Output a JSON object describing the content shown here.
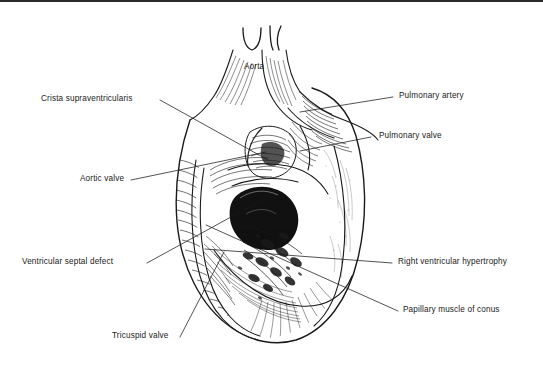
{
  "figure": {
    "kind": "anatomical-illustration",
    "style": "pen-and-ink line drawing",
    "background_color": "#ffffff",
    "ink_color": "#1a1a1a",
    "border": {
      "top_rule": true,
      "top_rule_color": "#2b2b2b"
    }
  },
  "labels": {
    "aorta": "Aorta",
    "crista_supraventricularis": "Crista supraventricularis",
    "aortic_valve": "Aortic valve",
    "ventricular_septal_defect": "Ventricular septal defect",
    "tricuspid_valve": "Tricuspid valve",
    "pulmonary_artery": "Pulmonary artery",
    "pulmonary_valve": "Pulmonary valve",
    "right_ventricular_hypertrophy": "Right ventricular hypertrophy",
    "papillary_muscle_of_conus": "Papillary muscle of conus"
  }
}
